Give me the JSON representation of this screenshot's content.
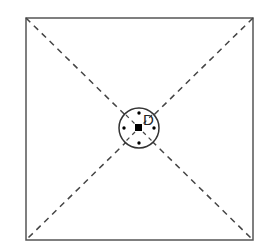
{
  "diagram": {
    "title": "",
    "square": {
      "x": 26,
      "y": 18,
      "size": 227
    },
    "center": {
      "x": 139,
      "y": 128
    },
    "circle_radius": 20,
    "label": "D",
    "dots": [
      {
        "x": 139,
        "y": 113
      },
      {
        "x": 124,
        "y": 128
      },
      {
        "x": 154,
        "y": 128
      },
      {
        "x": 139,
        "y": 143
      }
    ],
    "colors": {
      "stroke": "#444444",
      "fill": "#000000",
      "background": "#ffffff"
    }
  }
}
